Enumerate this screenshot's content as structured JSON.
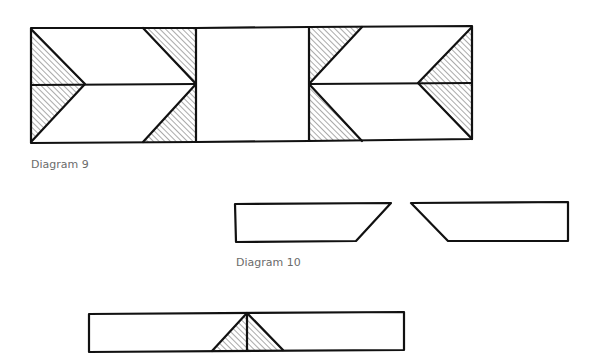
{
  "diagrams": [
    {
      "id": "diagram-9",
      "caption": "Diagram 9",
      "description": "Three-block row: left and right blocks each split horizontally into two rectangles with hatched half-square triangles forming flying-geese/arrow motifs; plain center block."
    },
    {
      "id": "diagram-10",
      "caption": "Diagram 10",
      "description": "Two separate trapezoid strips with angled inner ends facing each other."
    },
    {
      "id": "diagram-11",
      "caption": "",
      "description": "Long strip with a hatched triangle centered on its lower edge, split by a vertical line."
    }
  ],
  "colors": {
    "stroke": "#111111",
    "hatch": "#555555",
    "caption": "#6b6b6b",
    "background": "#ffffff"
  }
}
